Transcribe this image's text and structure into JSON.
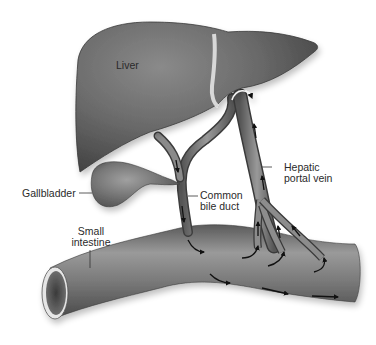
{
  "diagram": {
    "type": "anatomical-illustration",
    "labels": {
      "liver": "Liver",
      "gallbladder": "Gallbladder",
      "common_bile_duct": "Common\nbile duct",
      "hepatic_portal_vein": "Hepatic\nportal vein",
      "small_intestine": "Small\nintestine"
    },
    "colors": {
      "organ_dark": "#4a4a4a",
      "organ_mid": "#767676",
      "organ_light": "#a8a8a8",
      "ligament": "#d8d8d8",
      "arrow": "#1a1a1a",
      "text": "#2a2a2a",
      "background": "#ffffff"
    },
    "flow_arrows": {
      "bile_duct": "downward toward small intestine",
      "portal_vein": "upward toward liver",
      "intestine": "left to right"
    }
  }
}
